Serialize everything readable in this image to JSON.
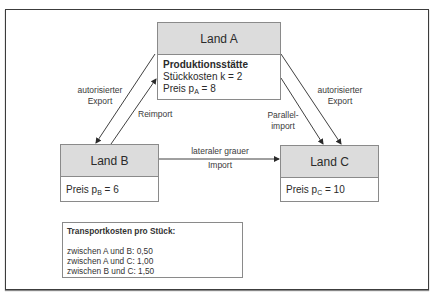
{
  "diagram": {
    "countries": {
      "a": {
        "title": "Land A",
        "facility": "Produktionsstätte",
        "unit_cost": "Stückkosten k = 2",
        "price_prefix": "Preis p",
        "price_sub": "A",
        "price_suffix": " = 8"
      },
      "b": {
        "title": "Land B",
        "price_prefix": "Preis p",
        "price_sub": "B",
        "price_suffix": " = 6"
      },
      "c": {
        "title": "Land C",
        "price_prefix": "Preis p",
        "price_sub": "C",
        "price_suffix": " = 10"
      }
    },
    "flows": {
      "left_export": {
        "line1": "autorisierter",
        "line2": "Export",
        "from": "Land A",
        "to": "Land B"
      },
      "reimport": {
        "label": "Reimport",
        "from": "Land B",
        "to": "Land A"
      },
      "lateral": {
        "line1": "lateraler grauer",
        "line2": "Import",
        "from": "Land B",
        "to": "Land C"
      },
      "parallel_import": {
        "line1": "Parallel-",
        "line2": "import",
        "from": "Land A",
        "to": "Land C"
      },
      "right_export": {
        "line1": "autorisierter",
        "line2": "Export",
        "from": "Land A",
        "to": "Land C"
      }
    },
    "transport": {
      "title": "Transportkosten pro Stück:",
      "items": [
        "zwischen A und B: 0,50",
        "zwischen A und C: 1,00",
        "zwischen B und C: 1,50"
      ]
    },
    "colors": {
      "header_fill": "#dcdcdc",
      "border": "#8a8a8a",
      "arrow": "#2a2a2a"
    }
  }
}
